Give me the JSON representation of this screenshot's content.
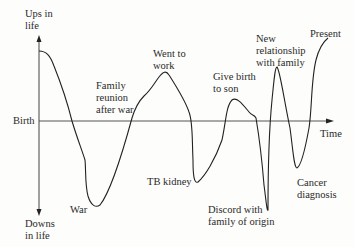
{
  "diagram": {
    "type": "life-line",
    "axes": {
      "y_top_label": "Ups in\nlife",
      "y_bottom_label": "Downs\nin life",
      "x_origin_label": "Birth",
      "x_end_label": "Time"
    },
    "events": [
      {
        "id": "war",
        "label": "War",
        "direction": "down"
      },
      {
        "id": "family-reunion",
        "label": "Family\nreunion\nafter war",
        "direction": "up"
      },
      {
        "id": "went-to-work",
        "label": "Went to\nwork",
        "direction": "up"
      },
      {
        "id": "tb-kidney",
        "label": "TB kidney",
        "direction": "down"
      },
      {
        "id": "give-birth",
        "label": "Give birth\nto son",
        "direction": "up"
      },
      {
        "id": "discord",
        "label": "Discord with\nfamily of origin",
        "direction": "down"
      },
      {
        "id": "new-relationship",
        "label": "New\nrelationship\nwith family",
        "direction": "up"
      },
      {
        "id": "cancer",
        "label": "Cancer\ndiagnosis",
        "direction": "down"
      },
      {
        "id": "present",
        "label": "Present",
        "direction": "up"
      }
    ],
    "colors": {
      "line": "#222222",
      "axis": "#444444",
      "background": "#fdfdfb"
    }
  }
}
